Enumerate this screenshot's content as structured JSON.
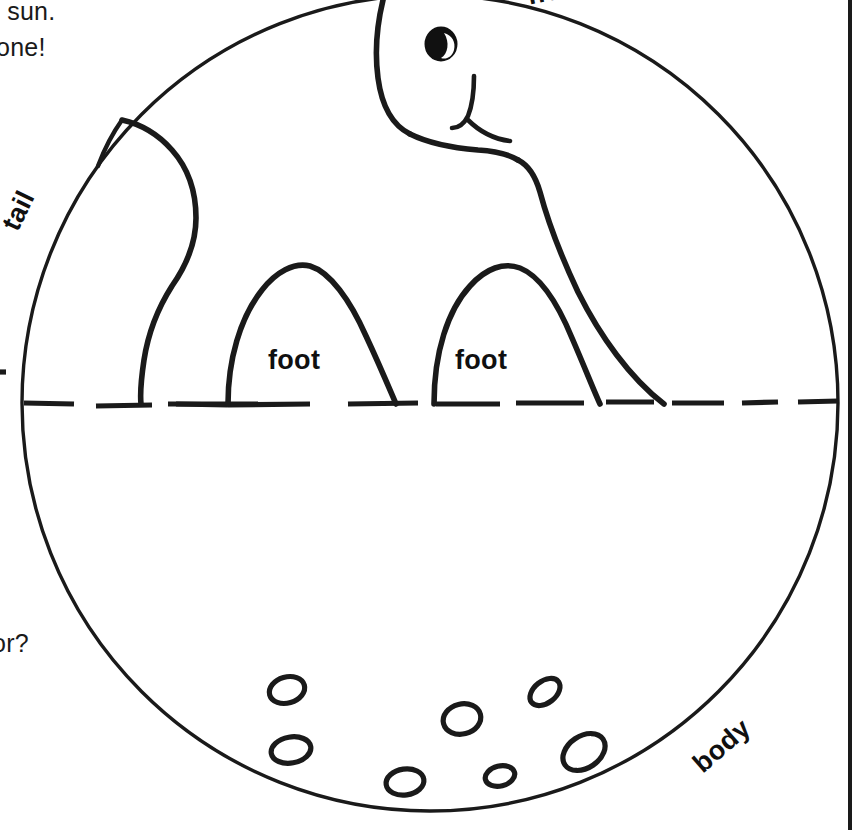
{
  "page": {
    "width": 852,
    "height": 830,
    "background_color": "#ffffff",
    "ink_color": "#1a1a1a"
  },
  "cropped_text": {
    "top_line_1": "e sun.",
    "top_line_2": "none!",
    "lower_left": "oor?"
  },
  "part_labels": {
    "head": "head",
    "tail": "tail",
    "body": "body",
    "foot_left": "foot",
    "foot_right": "foot"
  },
  "figure": {
    "circle": {
      "center_x": 430,
      "center_y": 403,
      "radius_x": 408,
      "radius_y": 408,
      "stroke_width": 3
    },
    "dashed_line": {
      "y": 403,
      "x_start": 22,
      "x_end": 838,
      "stroke_width": 5
    },
    "eye": {
      "cx": 441,
      "cy": 44,
      "rx": 15,
      "ry": 16
    },
    "spot_count": 7
  },
  "colors": {
    "ink": "#1a1a1a",
    "paper": "#ffffff",
    "eye_fill": "#111111"
  }
}
